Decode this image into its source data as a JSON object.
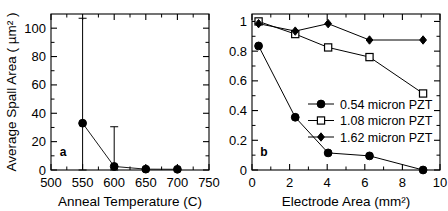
{
  "figure": {
    "background": "#ffffff",
    "axis_color": "#000000",
    "marker_color": "#000000"
  },
  "chart_data": [
    {
      "type": "scatter",
      "panel_label": "a",
      "title": "",
      "xlabel": "Anneal Temperature (C)",
      "ylabel": "Average Spall Area ( µm² )",
      "xlim": [
        500,
        750
      ],
      "ylim": [
        0,
        110
      ],
      "xticks": [
        500,
        550,
        600,
        650,
        700,
        750
      ],
      "xticklabels": [
        "500",
        "550",
        "600",
        "650",
        "700",
        "750"
      ],
      "yticks": [
        0,
        20,
        40,
        60,
        80,
        100
      ],
      "yticklabels": [
        "0",
        "20",
        "40",
        "60",
        "80",
        "100"
      ],
      "grid": false,
      "legend": "none",
      "series": [
        {
          "name": "Average Spall Area",
          "marker": "filled-circle",
          "x": [
            550,
            600,
            650,
            700
          ],
          "values": [
            33,
            2.5,
            0.6,
            0.5
          ],
          "err_low": [
            33,
            2.5,
            0.6,
            0.5
          ],
          "err_high": [
            74,
            28,
            0,
            0
          ],
          "err_top": [
            107,
            30.5,
            0.6,
            0.5
          ],
          "err_bottom": [
            0,
            0,
            0.6,
            0.5
          ]
        }
      ]
    },
    {
      "type": "line",
      "panel_label": "b",
      "title": "",
      "xlabel": "Electrode Area (mm²)",
      "ylabel": "Yield (fraction)",
      "xlim": [
        0,
        10
      ],
      "ylim": [
        0,
        1.05
      ],
      "xticks": [
        0,
        2,
        4,
        6,
        8,
        10
      ],
      "xticklabels": [
        "0",
        "2",
        "4",
        "6",
        "8",
        "10"
      ],
      "yticks": [
        0,
        0.2,
        0.4,
        0.6,
        0.8,
        1
      ],
      "yticklabels": [
        "0",
        "0.2",
        "0.4",
        "0.6",
        "0.8",
        "1"
      ],
      "grid": false,
      "legend": "inside-center-right",
      "series": [
        {
          "name": "0.54 micron PZT",
          "marker": "filled-circle",
          "x": [
            0.35,
            2.3,
            4.05,
            6.25,
            9.1
          ],
          "values": [
            0.835,
            0.355,
            0.115,
            0.095,
            0.0
          ]
        },
        {
          "name": "1.08 micron PZT",
          "marker": "open-square",
          "x": [
            0.35,
            2.3,
            4.05,
            6.25,
            9.1
          ],
          "values": [
            1.0,
            0.915,
            0.825,
            0.76,
            0.515
          ]
        },
        {
          "name": "1.62 micron PZT",
          "marker": "filled-diamond",
          "x": [
            0.35,
            2.3,
            4.05,
            6.25,
            9.1
          ],
          "values": [
            0.985,
            0.935,
            0.985,
            0.875,
            0.875
          ]
        }
      ]
    }
  ]
}
